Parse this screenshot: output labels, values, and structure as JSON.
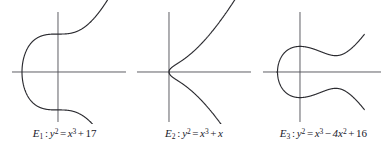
{
  "figure": {
    "background_color": "#ffffff",
    "curve_color": "#2b2b30",
    "axis_color": "#4d4d52",
    "panel_count": 3
  },
  "panels": [
    {
      "id": "E1",
      "caption_text": "E₁ : y² = x³ + 17",
      "label": "E",
      "label_sub": "1",
      "lhs_var": "y",
      "lhs_exp": "2",
      "rhs_var": "x",
      "rhs_exp": "3",
      "rhs_terms": [
        {
          "op": "+",
          "text": "17"
        }
      ],
      "axes": {
        "origin_x": 58,
        "origin_y": 72,
        "x_axis_start": 12,
        "x_axis_end": 126,
        "y_axis_top": 12,
        "y_axis_bottom": 122
      },
      "curve": {
        "equation": "y^2 = x^3 + 17",
        "a": 0,
        "b": 17,
        "real_root_x": -2.5713,
        "x_scale": 14.0,
        "y_scale": 9.2,
        "x_min": -2.5713,
        "x_max": 4.75,
        "components": [
          "unbounded"
        ],
        "x_intercepts": [
          -2.5713
        ],
        "y_intercepts": [
          4.1231,
          -4.1231
        ]
      }
    },
    {
      "id": "E2",
      "caption_text": "E₂ : y² = x³ + x",
      "label": "E",
      "label_sub": "2",
      "lhs_var": "y",
      "lhs_exp": "2",
      "rhs_var": "x",
      "rhs_exp": "3",
      "rhs_terms": [
        {
          "op": "+",
          "text": "x",
          "italic": true
        }
      ],
      "axes": {
        "origin_x": 40,
        "origin_y": 72,
        "x_axis_start": 8,
        "x_axis_end": 122,
        "y_axis_top": 12,
        "y_axis_bottom": 122
      },
      "curve": {
        "equation": "y^2 = x^3 + x",
        "a": 1,
        "b": 0,
        "real_root_x": 0,
        "x_scale": 21.0,
        "y_scale": 12.4,
        "x_min": 0,
        "x_max": 3.95,
        "components": [
          "unbounded"
        ],
        "x_intercepts": [
          0
        ],
        "y_intercepts": [
          0
        ]
      }
    },
    {
      "id": "E3",
      "caption_text": "E₃ : y² = x³ − 4x² + 16",
      "label": "E",
      "label_sub": "3",
      "lhs_var": "y",
      "lhs_exp": "2",
      "rhs_var": "x",
      "rhs_exp": "3",
      "rhs_terms": [
        {
          "op": "−",
          "text": "4x",
          "italic": true,
          "exp": "2"
        },
        {
          "op": "+",
          "text": "16"
        }
      ],
      "axes": {
        "origin_x": 41,
        "origin_y": 72,
        "x_axis_start": 4,
        "x_axis_end": 122,
        "y_axis_top": 12,
        "y_axis_bottom": 122
      },
      "curve": {
        "equation": "y^2 = x^3 - 4x^2 + 16",
        "a2": -4,
        "a": 0,
        "b": 16,
        "real_root_x": -1.7356,
        "x_scale": 13.4,
        "y_scale": 6.4,
        "x_min": -1.7356,
        "x_max": 4.8,
        "components": [
          "unbounded"
        ],
        "x_intercepts": [
          -1.7356
        ],
        "y_intercepts": [
          4.0,
          -4.0
        ]
      }
    }
  ]
}
